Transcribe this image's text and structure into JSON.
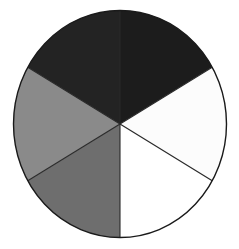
{
  "figure": {
    "background_color": "#ffffff",
    "canvas": {
      "width": 239,
      "height": 249
    },
    "outline_color": "#1a1a1a",
    "outline_width": 1.4,
    "divider_color": "#2a2a2a",
    "divider_width": 1.1
  },
  "chart_data": {
    "type": "pie",
    "xlabel": "",
    "ylabel": "",
    "grid": false,
    "legend_position": "none",
    "center": {
      "x": 120,
      "y": 124
    },
    "radius_x": 106.5,
    "radius_y": 113.5,
    "slice_count": 6,
    "slice_angle_degrees": 60,
    "start_angle_degrees": 90,
    "direction": "clockwise",
    "categories": [
      "top-right sector",
      "right sector",
      "bottom-right sector",
      "bottom-left sector",
      "left sector",
      "top-left sector"
    ],
    "values": [
      60,
      60,
      60,
      60,
      60,
      60
    ],
    "percentages": [
      16.7,
      16.7,
      16.7,
      16.7,
      16.7,
      16.7
    ],
    "colors": [
      "#1c1c1c",
      "#fcfcfc",
      "#ffffff",
      "#6e6e6e",
      "#8a8a8a",
      "#232323"
    ],
    "slices": [
      {
        "name": "top-right sector",
        "shade": "near-black",
        "color": "#1c1c1c",
        "value": 60,
        "percent": 16.7,
        "start_angle": 90,
        "end_angle": 30
      },
      {
        "name": "right sector",
        "shade": "white",
        "color": "#fcfcfc",
        "value": 60,
        "percent": 16.7,
        "start_angle": 30,
        "end_angle": -30
      },
      {
        "name": "bottom-right sector",
        "shade": "white",
        "color": "#ffffff",
        "value": 60,
        "percent": 16.7,
        "start_angle": -30,
        "end_angle": -90
      },
      {
        "name": "bottom-left sector",
        "shade": "medium-gray",
        "color": "#6e6e6e",
        "value": 60,
        "percent": 16.7,
        "start_angle": -90,
        "end_angle": -150
      },
      {
        "name": "left sector",
        "shade": "light-gray",
        "color": "#8a8a8a",
        "value": 60,
        "percent": 16.7,
        "start_angle": -150,
        "end_angle": -210
      },
      {
        "name": "top-left sector",
        "shade": "near-black",
        "color": "#232323",
        "value": 60,
        "percent": 16.7,
        "start_angle": 150,
        "end_angle": 90
      }
    ]
  }
}
